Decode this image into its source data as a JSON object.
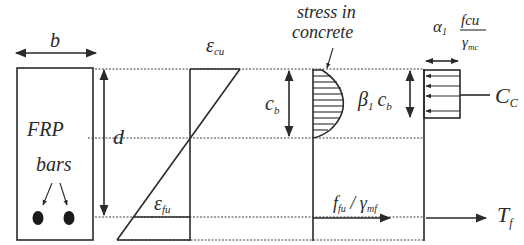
{
  "diagram": {
    "type": "flexural-section-analysis",
    "section": {
      "width_label": "b",
      "depth_label": "d",
      "material_label_line1": "FRP",
      "material_label_line2": "bars"
    },
    "strain": {
      "top_label_symbol": "ε",
      "top_label_sub": "cu",
      "bottom_label_symbol": "ε",
      "bottom_label_sub": "fu"
    },
    "stress": {
      "title_line1": "stress in",
      "title_line2": "concrete",
      "neutral_axis_label": "c",
      "neutral_axis_sub": "b",
      "block_depth_beta": "β",
      "block_depth_beta_sub": "1",
      "block_depth_c": "c",
      "block_depth_c_sub": "b",
      "frp_stress_f": "f",
      "frp_stress_f_sub": "fu",
      "frp_stress_sep": " / ",
      "frp_stress_gamma": "γ",
      "frp_stress_gamma_sub": "mf"
    },
    "forces": {
      "alpha": "α",
      "alpha_sub": "1",
      "fcu": "fcu",
      "gamma": "γ",
      "gamma_sub": "mc",
      "compression_label": "C",
      "compression_sub": "C",
      "tension_label": "T",
      "tension_sub": "f"
    },
    "colors": {
      "line": "#2a2a2a",
      "background": "#ffffff"
    }
  }
}
